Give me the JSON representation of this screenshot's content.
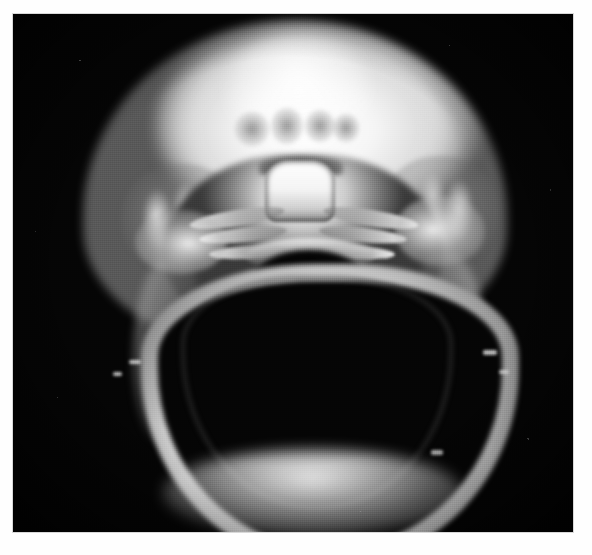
{
  "image": {
    "kind": "medical-radiograph",
    "modality_label": "",
    "view": "",
    "caption": "",
    "film": {
      "background_color": "#050505",
      "border_color": "#d8d8d8",
      "margin_color": "#fefefe",
      "left": 13,
      "top": 14,
      "width": 560,
      "height": 518
    },
    "palette": {
      "bone_bright": "#ffffff",
      "bone_mid": "#b8b8b8",
      "soft_tissue": "#6a6a6a",
      "air_dark": "#050505",
      "page_white": "#fefefe"
    },
    "structures": [
      {
        "name": "calvarium",
        "label": ""
      },
      {
        "name": "vault-highlight",
        "label": ""
      },
      {
        "name": "suture-marks",
        "label": ""
      },
      {
        "name": "skull-base",
        "label": ""
      },
      {
        "name": "clivus",
        "label": ""
      },
      {
        "name": "petrous-ridges",
        "label": ""
      },
      {
        "name": "foramen-magnum",
        "label": ""
      },
      {
        "name": "paranasal-sinuses",
        "label": ""
      },
      {
        "name": "cervical-spine",
        "label": ""
      },
      {
        "name": "mandible-arc",
        "label": ""
      },
      {
        "name": "mandibular-ramus-left",
        "label": ""
      },
      {
        "name": "mandibular-ramus-right",
        "label": ""
      },
      {
        "name": "mastoid-right",
        "label": ""
      },
      {
        "name": "mastoid-left",
        "label": ""
      },
      {
        "name": "temporal-bone-left",
        "label": ""
      },
      {
        "name": "temporal-bone-right",
        "label": ""
      }
    ]
  }
}
